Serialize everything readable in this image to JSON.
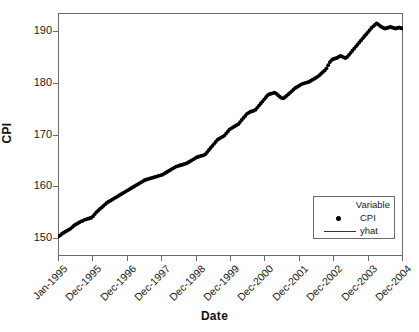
{
  "chart_data": {
    "type": "scatter",
    "title": "",
    "xlabel": "Date",
    "ylabel": "CPI",
    "grid": false,
    "legend_position": "bottom-right",
    "legend_title": "Variable",
    "ylim": [
      146.5,
      193.5
    ],
    "yticks": [
      150,
      160,
      170,
      180,
      190
    ],
    "ytick_labels": [
      "150",
      "160",
      "170",
      "180",
      "190"
    ],
    "xtick_labels": [
      "Jan-1995",
      "Dec-1995",
      "Dec-1996",
      "Dec-1997",
      "Dec-1998",
      "Dec-1999",
      "Dec-2000",
      "Dec-2001",
      "Dec-2002",
      "Dec-2003",
      "Dec-2004"
    ],
    "series": [
      {
        "name": "CPI",
        "marker": "filled-circle",
        "color": "#000000",
        "x_start": "Jan-1995",
        "x_end": "Dec-2004",
        "x_step": "monthly",
        "values": [
          150.3,
          150.5,
          150.8,
          151.0,
          151.2,
          151.4,
          151.6,
          151.8,
          152.1,
          152.4,
          152.6,
          152.8,
          153.0,
          153.2,
          153.3,
          153.5,
          153.6,
          153.7,
          153.8,
          153.9,
          154.2,
          154.6,
          155.0,
          155.3,
          155.6,
          155.9,
          156.2,
          156.5,
          156.8,
          157.0,
          157.2,
          157.4,
          157.6,
          157.8,
          158.0,
          158.2,
          158.4,
          158.6,
          158.8,
          159.0,
          159.2,
          159.4,
          159.6,
          159.8,
          160.0,
          160.2,
          160.4,
          160.6,
          160.8,
          161.0,
          161.2,
          161.3,
          161.4,
          161.5,
          161.6,
          161.7,
          161.8,
          161.9,
          162.0,
          162.1,
          162.2,
          162.4,
          162.6,
          162.8,
          163.0,
          163.2,
          163.4,
          163.6,
          163.8,
          163.9,
          164.0,
          164.1,
          164.2,
          164.3,
          164.4,
          164.6,
          164.8,
          165.0,
          165.2,
          165.4,
          165.6,
          165.7,
          165.8,
          165.9,
          166.0,
          166.2,
          166.6,
          167.0,
          167.4,
          167.8,
          168.2,
          168.6,
          169.0,
          169.2,
          169.4,
          169.6,
          169.8,
          170.2,
          170.6,
          171.0,
          171.2,
          171.4,
          171.6,
          171.8,
          172.0,
          172.4,
          172.8,
          173.2,
          173.6,
          174.0,
          174.2,
          174.4,
          174.5,
          174.6,
          174.8,
          175.2,
          175.6,
          176.0,
          176.4,
          176.8,
          177.2,
          177.6,
          177.8,
          177.9,
          178.0,
          178.1,
          177.9,
          177.6,
          177.3,
          177.1,
          177.0,
          177.2,
          177.5,
          177.8,
          178.1,
          178.4,
          178.7,
          179.0,
          179.2,
          179.4,
          179.6,
          179.8,
          179.9,
          180.0,
          180.1,
          180.2,
          180.4,
          180.6,
          180.8,
          181.0,
          181.2,
          181.5,
          181.8,
          182.1,
          182.4,
          182.8,
          183.4,
          184.0,
          184.4,
          184.6,
          184.7,
          184.8,
          185.0,
          185.2,
          185.1,
          184.9,
          184.8,
          185.0,
          185.4,
          185.8,
          186.2,
          186.6,
          187.0,
          187.4,
          187.8,
          188.2,
          188.6,
          189.0,
          189.4,
          189.8,
          190.2,
          190.6,
          190.9,
          191.2,
          191.5,
          191.3,
          191.0,
          190.8,
          190.6,
          190.5,
          190.6,
          190.7,
          190.8,
          190.7,
          190.6,
          190.5,
          190.6,
          190.7,
          190.6,
          190.5
        ]
      },
      {
        "name": "yhat",
        "marker": "line",
        "color": "#333333",
        "description": "fitted trend line overlapping the CPI point cloud"
      }
    ]
  },
  "axes": {
    "y_title": "CPI",
    "x_title": "Date"
  },
  "legend": {
    "title": "Variable",
    "entries": [
      {
        "label": "CPI",
        "key": "filled-circle"
      },
      {
        "label": "yhat",
        "key": "line"
      }
    ]
  },
  "colors": {
    "marker": "#000000",
    "line": "#333333",
    "frame": "#6b6b6b",
    "background": "#ffffff",
    "text": "#1a1a1a"
  }
}
